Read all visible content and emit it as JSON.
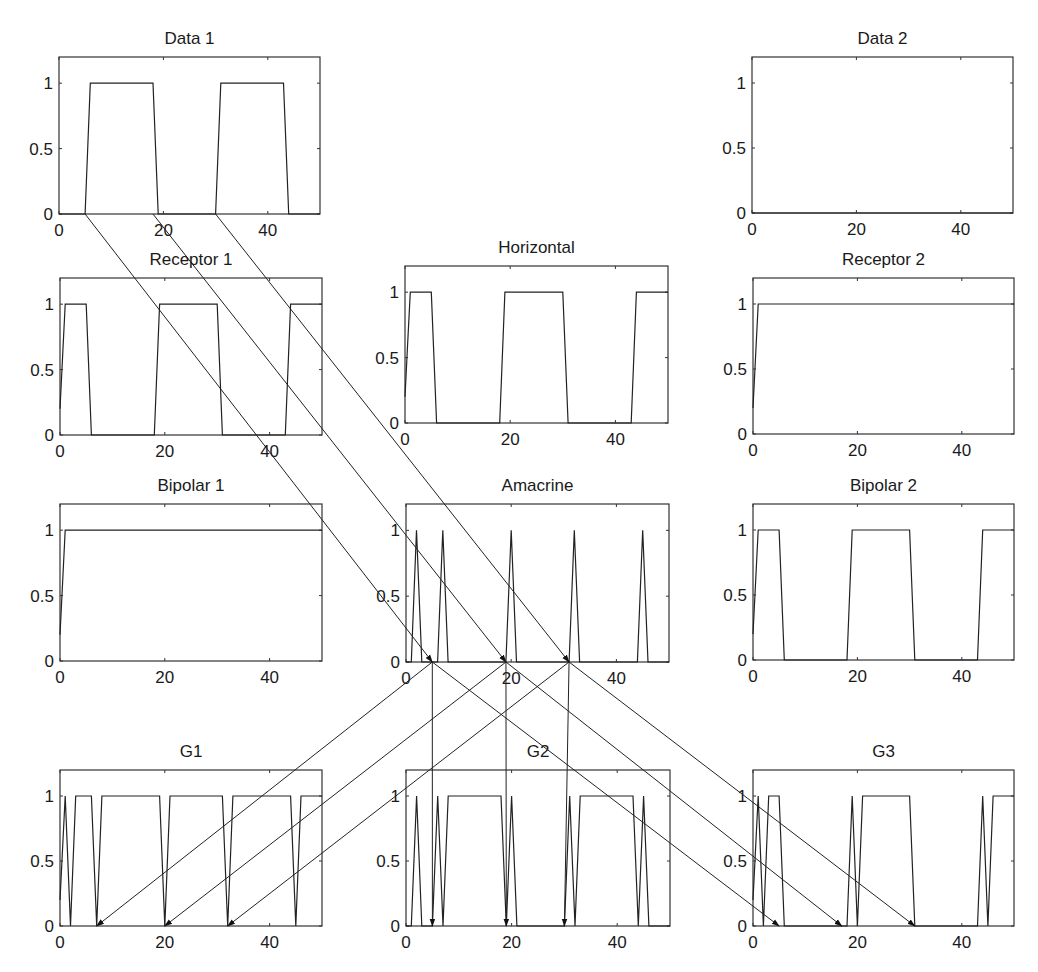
{
  "chart_data": [
    {
      "id": "data1",
      "type": "line",
      "title": "Data 1",
      "xlim": [
        0,
        50
      ],
      "ylim": [
        0,
        1.2
      ],
      "xticks": [
        "0",
        "20",
        "40"
      ],
      "xtick_values": [
        0,
        20,
        40
      ],
      "yticks": [
        "0",
        "0.5",
        "1"
      ],
      "ytick_values": [
        0,
        0.5,
        1
      ],
      "x": [
        0,
        5,
        6,
        18,
        19,
        30,
        31,
        43,
        44,
        50
      ],
      "y": [
        0,
        0,
        1,
        1,
        0,
        0,
        1,
        1,
        0,
        0
      ]
    },
    {
      "id": "data2",
      "type": "line",
      "title": "Data 2",
      "xlim": [
        0,
        50
      ],
      "ylim": [
        0,
        1.2
      ],
      "xticks": [
        "0",
        "20",
        "40"
      ],
      "xtick_values": [
        0,
        20,
        40
      ],
      "yticks": [
        "0",
        "0.5",
        "1"
      ],
      "ytick_values": [
        0,
        0.5,
        1
      ],
      "x": [
        0,
        50
      ],
      "y": [
        0,
        0
      ]
    },
    {
      "id": "receptor1",
      "type": "line",
      "title": "Receptor 1",
      "xlim": [
        0,
        50
      ],
      "ylim": [
        0,
        1.2
      ],
      "xticks": [
        "0",
        "20",
        "40"
      ],
      "xtick_values": [
        0,
        20,
        40
      ],
      "yticks": [
        "0",
        "0.5",
        "1"
      ],
      "ytick_values": [
        0,
        0.5,
        1
      ],
      "x": [
        0,
        0.5,
        1,
        5,
        6,
        18,
        19,
        30,
        31,
        43,
        44,
        50
      ],
      "y": [
        0.2,
        0.6,
        1,
        1,
        0,
        0,
        1,
        1,
        0,
        0,
        1,
        1
      ]
    },
    {
      "id": "horizontal",
      "type": "line",
      "title": "Horizontal",
      "xlim": [
        0,
        50
      ],
      "ylim": [
        0,
        1.2
      ],
      "xticks": [
        "0",
        "20",
        "40"
      ],
      "xtick_values": [
        0,
        20,
        40
      ],
      "yticks": [
        "0",
        "0.5",
        "1"
      ],
      "ytick_values": [
        0,
        0.5,
        1
      ],
      "x": [
        0,
        0.5,
        1,
        5,
        6,
        18,
        19,
        30,
        31,
        43,
        44,
        50
      ],
      "y": [
        0.2,
        0.6,
        1,
        1,
        0,
        0,
        1,
        1,
        0,
        0,
        1,
        1
      ]
    },
    {
      "id": "receptor2",
      "type": "line",
      "title": "Receptor 2",
      "xlim": [
        0,
        50
      ],
      "ylim": [
        0,
        1.2
      ],
      "xticks": [
        "0",
        "20",
        "40"
      ],
      "xtick_values": [
        0,
        20,
        40
      ],
      "yticks": [
        "0",
        "0.5",
        "1"
      ],
      "ytick_values": [
        0,
        0.5,
        1
      ],
      "x": [
        0,
        0.5,
        1,
        50
      ],
      "y": [
        0.2,
        0.6,
        1,
        1
      ]
    },
    {
      "id": "bipolar1",
      "type": "line",
      "title": "Bipolar 1",
      "xlim": [
        0,
        50
      ],
      "ylim": [
        0,
        1.2
      ],
      "xticks": [
        "0",
        "20",
        "40"
      ],
      "xtick_values": [
        0,
        20,
        40
      ],
      "yticks": [
        "0",
        "0.5",
        "1"
      ],
      "ytick_values": [
        0,
        0.5,
        1
      ],
      "x": [
        0,
        0.5,
        1,
        50
      ],
      "y": [
        0.2,
        0.6,
        1,
        1
      ]
    },
    {
      "id": "amacrine",
      "type": "line",
      "title": "Amacrine",
      "xlim": [
        0,
        50
      ],
      "ylim": [
        0,
        1.2
      ],
      "xticks": [
        "0",
        "20",
        "40"
      ],
      "xtick_values": [
        0,
        20,
        40
      ],
      "yticks": [
        "0",
        "0.5",
        "1"
      ],
      "ytick_values": [
        0,
        0.5,
        1
      ],
      "x": [
        0,
        1,
        2,
        3,
        6,
        7,
        8,
        19,
        20,
        21,
        31,
        32,
        33,
        44,
        45,
        46,
        50
      ],
      "y": [
        0,
        0,
        1,
        0,
        0,
        1,
        0,
        0,
        1,
        0,
        0,
        1,
        0,
        0,
        1,
        0,
        0
      ]
    },
    {
      "id": "bipolar2",
      "type": "line",
      "title": "Bipolar 2",
      "xlim": [
        0,
        50
      ],
      "ylim": [
        0,
        1.2
      ],
      "xticks": [
        "0",
        "20",
        "40"
      ],
      "xtick_values": [
        0,
        20,
        40
      ],
      "yticks": [
        "0",
        "0.5",
        "1"
      ],
      "ytick_values": [
        0,
        0.5,
        1
      ],
      "x": [
        0,
        0.5,
        1,
        5,
        6,
        18,
        19,
        30,
        31,
        43,
        44,
        50
      ],
      "y": [
        0.2,
        0.6,
        1,
        1,
        0,
        0,
        1,
        1,
        0,
        0,
        1,
        1
      ]
    },
    {
      "id": "g1",
      "type": "line",
      "title": "G1",
      "xlim": [
        0,
        50
      ],
      "ylim": [
        0,
        1.2
      ],
      "xticks": [
        "0",
        "20",
        "40"
      ],
      "xtick_values": [
        0,
        20,
        40
      ],
      "yticks": [
        "0",
        "0.5",
        "1"
      ],
      "ytick_values": [
        0,
        0.5,
        1
      ],
      "x": [
        0,
        1,
        2,
        3,
        6,
        7,
        8,
        19,
        20,
        21,
        31,
        32,
        33,
        44,
        45,
        46,
        50
      ],
      "y": [
        0.2,
        1,
        0,
        1,
        1,
        0,
        1,
        1,
        0,
        1,
        1,
        0,
        1,
        1,
        0,
        1,
        1
      ]
    },
    {
      "id": "g2",
      "type": "line",
      "title": "G2",
      "xlim": [
        0,
        50
      ],
      "ylim": [
        0,
        1.2
      ],
      "xticks": [
        "0",
        "20",
        "40"
      ],
      "xtick_values": [
        0,
        20,
        40
      ],
      "yticks": [
        "0",
        "0.5",
        "1"
      ],
      "ytick_values": [
        0,
        0.5,
        1
      ],
      "x": [
        0,
        1,
        2,
        3,
        5,
        6,
        7,
        8,
        18,
        19,
        20,
        21,
        30,
        31,
        32,
        33,
        43,
        44,
        45,
        46,
        50
      ],
      "y": [
        0,
        0,
        1,
        0,
        0,
        1,
        0,
        1,
        1,
        0,
        1,
        0,
        0,
        1,
        0,
        1,
        1,
        0,
        1,
        0,
        0
      ]
    },
    {
      "id": "g3",
      "type": "line",
      "title": "G3",
      "xlim": [
        0,
        50
      ],
      "ylim": [
        0,
        1.2
      ],
      "xticks": [
        "0",
        "20",
        "40"
      ],
      "xtick_values": [
        0,
        20,
        40
      ],
      "yticks": [
        "0",
        "0.5",
        "1"
      ],
      "ytick_values": [
        0,
        0.5,
        1
      ],
      "x": [
        0,
        1,
        2,
        3,
        5,
        6,
        18,
        19,
        20,
        21,
        30,
        31,
        43,
        44,
        45,
        46,
        50
      ],
      "y": [
        0.2,
        1,
        0,
        1,
        1,
        0,
        0,
        1,
        0,
        1,
        1,
        0,
        0,
        1,
        0,
        1,
        1
      ]
    }
  ],
  "connections": [
    {
      "from": "data1",
      "from_x": 5,
      "to": "amacrine",
      "to_x": 5
    },
    {
      "from": "data1",
      "from_x": 18,
      "to": "amacrine",
      "to_x": 19
    },
    {
      "from": "data1",
      "from_x": 30,
      "to": "amacrine",
      "to_x": 31
    },
    {
      "from": "amacrine",
      "from_x": 5,
      "to": "g1",
      "to_x": 7
    },
    {
      "from": "amacrine",
      "from_x": 19,
      "to": "g1",
      "to_x": 20
    },
    {
      "from": "amacrine",
      "from_x": 31,
      "to": "g1",
      "to_x": 32
    },
    {
      "from": "amacrine",
      "from_x": 5,
      "to": "g2",
      "to_x": 5
    },
    {
      "from": "amacrine",
      "from_x": 19,
      "to": "g2",
      "to_x": 19
    },
    {
      "from": "amacrine",
      "from_x": 31,
      "to": "g2",
      "to_x": 30
    },
    {
      "from": "amacrine",
      "from_x": 5,
      "to": "g3",
      "to_x": 5
    },
    {
      "from": "amacrine",
      "from_x": 19,
      "to": "g3",
      "to_x": 17
    },
    {
      "from": "amacrine",
      "from_x": 31,
      "to": "g3",
      "to_x": 31
    }
  ]
}
